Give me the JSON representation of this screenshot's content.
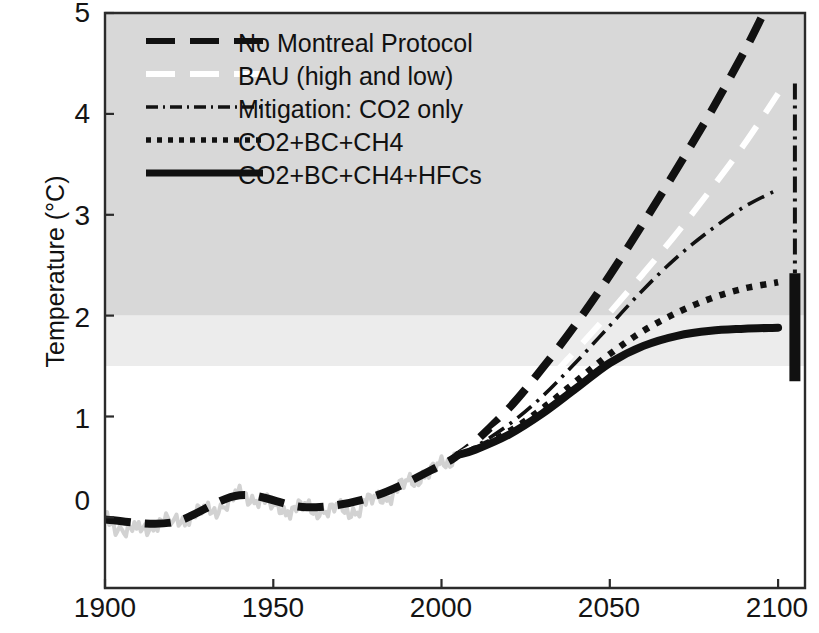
{
  "chart_data": {
    "type": "line",
    "title": "",
    "xlabel": "",
    "ylabel": "Temperature (°C)",
    "xlim": [
      1900,
      2108
    ],
    "ylim": [
      -0.7,
      5.0
    ],
    "xticks": [
      1900,
      1950,
      2000,
      2050,
      2100
    ],
    "yticks": [
      0,
      1,
      2,
      3,
      4,
      5
    ],
    "xtick_labels": [
      "1900",
      "1950",
      "2000",
      "2050",
      "2100"
    ],
    "ytick_labels": [
      "0",
      "1",
      "2",
      "3",
      "4",
      "5"
    ],
    "grid": false,
    "legend_position": "upper-left",
    "legend": [
      {
        "label": "No Montreal Protocol",
        "style": "dashed",
        "color": "#111111"
      },
      {
        "label": "BAU (high and low)",
        "style": "dashed-white",
        "color": "#ffffff"
      },
      {
        "label": "Mitigation: CO2 only",
        "style": "dash-dot",
        "color": "#111111"
      },
      {
        "label": "CO2+BC+CH4",
        "style": "dotted",
        "color": "#111111"
      },
      {
        "label": "CO2+BC+CH4+HFCs",
        "style": "solid",
        "color": "#111111"
      }
    ],
    "bands": [
      {
        "name": "upper-shading",
        "from": 2.0,
        "to": 5.0,
        "color": "#d8d8d8"
      },
      {
        "name": "mid-shading",
        "from": 1.5,
        "to": 2.0,
        "color": "#ececec"
      },
      {
        "name": "lower-shading",
        "from": -0.7,
        "to": 1.5,
        "color": "#ffffff"
      }
    ],
    "series": [
      {
        "name": "Observed / historical",
        "style": "noisy-gray",
        "x": [
          1900,
          1905,
          1910,
          1915,
          1920,
          1925,
          1930,
          1935,
          1940,
          1945,
          1950,
          1955,
          1960,
          1965,
          1970,
          1975,
          1980,
          1985,
          1990,
          1995,
          2000,
          2005
        ],
        "values": [
          -0.02,
          -0.12,
          -0.14,
          -0.05,
          -0.05,
          0.02,
          0.06,
          0.1,
          0.22,
          0.19,
          0.12,
          0.08,
          0.1,
          0.05,
          0.08,
          0.06,
          0.21,
          0.22,
          0.36,
          0.4,
          0.52,
          0.62
        ]
      },
      {
        "name": "No Montreal Protocol",
        "style": "dashed",
        "x": [
          1900,
          1920,
          1940,
          1960,
          1980,
          2000,
          2005,
          2010,
          2020,
          2030,
          2040,
          2050,
          2060,
          2070,
          2080,
          2090,
          2095
        ],
        "values": [
          -0.02,
          -0.05,
          0.22,
          0.1,
          0.21,
          0.52,
          0.62,
          0.75,
          1.08,
          1.48,
          1.92,
          2.4,
          2.92,
          3.46,
          4.02,
          4.62,
          4.95
        ]
      },
      {
        "name": "BAU (high and low)",
        "style": "dashed-white",
        "x": [
          2005,
          2010,
          2020,
          2030,
          2040,
          2050,
          2060,
          2070,
          2080,
          2090,
          2100
        ],
        "values": [
          0.62,
          0.72,
          0.98,
          1.3,
          1.66,
          2.03,
          2.42,
          2.82,
          3.25,
          3.7,
          4.2
        ]
      },
      {
        "name": "Mitigation: CO2 only",
        "style": "dash-dot",
        "x": [
          2005,
          2010,
          2020,
          2030,
          2040,
          2050,
          2060,
          2070,
          2080,
          2090,
          2100
        ],
        "values": [
          0.62,
          0.7,
          0.92,
          1.2,
          1.54,
          1.9,
          2.26,
          2.58,
          2.85,
          3.08,
          3.25
        ]
      },
      {
        "name": "CO2+BC+CH4",
        "style": "dotted",
        "x": [
          2005,
          2010,
          2020,
          2030,
          2040,
          2050,
          2060,
          2070,
          2080,
          2090,
          2100
        ],
        "values": [
          0.62,
          0.68,
          0.85,
          1.08,
          1.35,
          1.62,
          1.85,
          2.03,
          2.17,
          2.27,
          2.33
        ]
      },
      {
        "name": "CO2+BC+CH4+HFCs",
        "style": "solid",
        "x": [
          2005,
          2010,
          2020,
          2030,
          2040,
          2050,
          2060,
          2070,
          2080,
          2090,
          2100
        ],
        "values": [
          0.62,
          0.67,
          0.82,
          1.03,
          1.28,
          1.53,
          1.7,
          1.8,
          1.85,
          1.87,
          1.88
        ]
      }
    ],
    "uncertainty_bars": [
      {
        "name": "mitigation-co2-only-range",
        "x": 2105,
        "low": 2.42,
        "high": 4.3,
        "style": "dash-dot"
      },
      {
        "name": "co2-bc-ch4-hfcs-range",
        "x": 2105,
        "low": 1.35,
        "high": 2.42,
        "style": "solid-thick"
      }
    ]
  }
}
